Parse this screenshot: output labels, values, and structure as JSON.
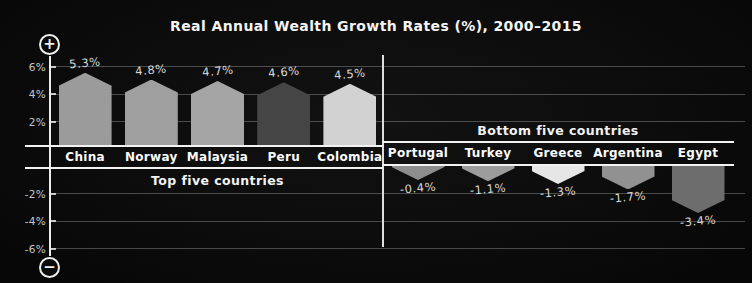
{
  "title": "Real Annual Wealth Growth Rates (%), 2000–2015",
  "zoom_controls": {
    "zoom_in_symbol": "+",
    "zoom_out_symbol": "−"
  },
  "colors": {
    "background": "#0c0c0c",
    "text": "#f4f4f4",
    "muted_text": "#c6c6c6",
    "grid": "rgba(255,255,255,0.26)",
    "axis": "#ececec"
  },
  "chart_data": {
    "type": "bar",
    "title": "Real Annual Wealth Growth Rates (%), 2000–2015",
    "xlabel": "",
    "ylabel": "",
    "ylim": [
      -7,
      7
    ],
    "grid": true,
    "yticks": [
      {
        "value": 6,
        "label": "6%"
      },
      {
        "value": 4,
        "label": "4%"
      },
      {
        "value": 2,
        "label": "2%"
      },
      {
        "value": -2,
        "label": "-2%"
      },
      {
        "value": -4,
        "label": "-4%"
      },
      {
        "value": -6,
        "label": "-6%"
      }
    ],
    "groups": [
      {
        "name": "Top five countries",
        "bars": [
          {
            "country": "China",
            "value": 5.3,
            "label": "5.3%",
            "color": "#9b9b9b"
          },
          {
            "country": "Norway",
            "value": 4.8,
            "label": "4.8%",
            "color": "#9f9f9f"
          },
          {
            "country": "Malaysia",
            "value": 4.7,
            "label": "4.7%",
            "color": "#a5a5a5"
          },
          {
            "country": "Peru",
            "value": 4.6,
            "label": "4.6%",
            "color": "#454545"
          },
          {
            "country": "Colombia",
            "value": 4.5,
            "label": "4.5%",
            "color": "#d2d2d2"
          }
        ]
      },
      {
        "name": "Bottom five countries",
        "bars": [
          {
            "country": "Portugal",
            "value": -0.4,
            "label": "-0.4%",
            "color": "#8d8d8d"
          },
          {
            "country": "Turkey",
            "value": -1.1,
            "label": "-1.1%",
            "color": "#9c9c9c"
          },
          {
            "country": "Greece",
            "value": -1.3,
            "label": "-1.3%",
            "color": "#e6e6e6"
          },
          {
            "country": "Argentina",
            "value": -1.7,
            "label": "-1.7%",
            "color": "#919191"
          },
          {
            "country": "Egypt",
            "value": -3.4,
            "label": "-3.4%",
            "color": "#6d6d6d"
          }
        ]
      }
    ]
  }
}
